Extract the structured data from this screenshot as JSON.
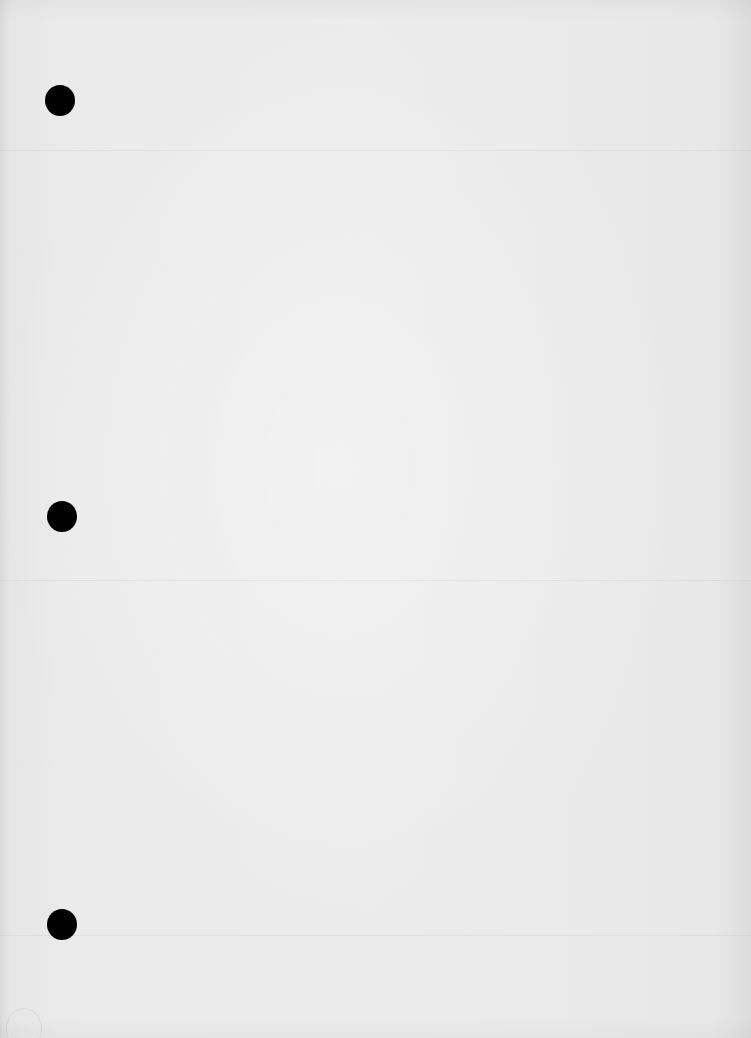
{
  "page": {
    "type": "blank three-hole-punched paper sheet",
    "background_color": "#e9e9e9",
    "holes": [
      {
        "name": "top",
        "cx": 60,
        "cy": 100,
        "diameter": 30,
        "color": "#000000"
      },
      {
        "name": "middle",
        "cx": 62,
        "cy": 516,
        "diameter": 30,
        "color": "#000000"
      },
      {
        "name": "bottom",
        "cx": 62,
        "cy": 924,
        "diameter": 30,
        "color": "#000000"
      }
    ]
  }
}
